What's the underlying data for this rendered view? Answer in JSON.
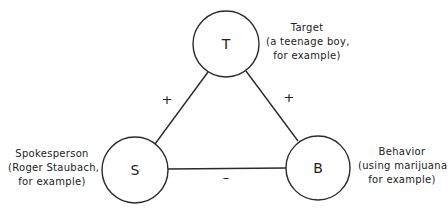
{
  "nodes": {
    "target": {
      "letter": "T",
      "title": "Target",
      "line1": "(a teenage boy,",
      "line2": "for example)"
    },
    "spokesperson": {
      "letter": "S",
      "title": "Spokesperson",
      "line1": "(Roger Staubach,",
      "line2": "for example)"
    },
    "behavior": {
      "letter": "B",
      "title": "Behavior",
      "line1": "(using marijuana,",
      "line2": "for example)"
    }
  },
  "edges": {
    "spokesperson_target": {
      "sign": "+"
    },
    "target_behavior": {
      "sign": "+"
    },
    "spokesperson_behavior": {
      "sign": "–"
    }
  },
  "colors": {
    "stroke": "#2a2a2a",
    "background": "#ffffff"
  }
}
